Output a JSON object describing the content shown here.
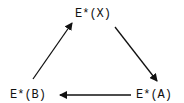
{
  "diagram": {
    "nodes": [
      {
        "id": "X",
        "label": "E*(X)"
      },
      {
        "id": "A",
        "label": "E*(A)"
      },
      {
        "id": "B",
        "label": "E*(B)"
      }
    ],
    "edges": [
      {
        "from": "B",
        "to": "X"
      },
      {
        "from": "X",
        "to": "A"
      },
      {
        "from": "A",
        "to": "B"
      }
    ],
    "colors": {
      "stroke": "#111111",
      "background": "#ffffff"
    }
  }
}
